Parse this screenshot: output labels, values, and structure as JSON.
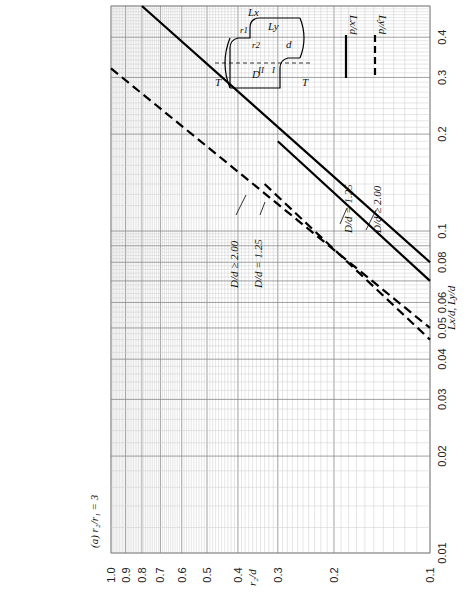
{
  "chart_data": {
    "type": "line",
    "xlabel": "r2/d",
    "ylabel": "Lx/d, Ly/d",
    "x_scale": "log",
    "y_scale": "log",
    "xlim": [
      1.0,
      0.1
    ],
    "ylim": [
      0.01,
      0.5
    ],
    "x_ticks": [
      "1.0",
      "0.9",
      "0.8",
      "0.7",
      "0.6",
      "0.5",
      "0.4",
      "0.3",
      "0.2",
      "0.1"
    ],
    "y_ticks": [
      "0.01",
      "0.02",
      "0.03",
      "0.04",
      "0.05",
      "0.06",
      "0.08",
      "0.1",
      "0.2",
      "0.3",
      "0.4"
    ],
    "grid": true,
    "legend": [
      {
        "label": "Lx/d",
        "style": "solid"
      },
      {
        "label": "Ly/d",
        "style": "dashed"
      }
    ],
    "legend_position": "top-right",
    "series": [
      {
        "name": "Lx/d, D/d ≥ 2.00",
        "style": "solid",
        "x": [
          0.8,
          0.1
        ],
        "y": [
          0.5,
          0.08
        ]
      },
      {
        "name": "Lx/d, D/d = 1.25",
        "style": "solid",
        "x": [
          0.3,
          0.1
        ],
        "y": [
          0.19,
          0.07
        ]
      },
      {
        "name": "Ly/d, D/d ≥ 2.00",
        "style": "dashed",
        "x": [
          1.0,
          0.1
        ],
        "y": [
          0.32,
          0.05
        ]
      },
      {
        "name": "Ly/d, D/d = 1.25",
        "style": "dashed",
        "x": [
          0.33,
          0.1
        ],
        "y": [
          0.14,
          0.046
        ]
      }
    ],
    "annotations": [
      "D/d ≥ 2.00",
      "D/d = 1.25",
      "D/d ≥ 2.00",
      "D/d = 1.25"
    ]
  },
  "labels": {
    "panel": "(a) r₂/r₁ = 3",
    "x_axis": "r₂/d",
    "y_axis": "Lx/d, Ly/d",
    "legend_solid": "Lx/d",
    "legend_dashed": "Ly/d",
    "ann_solid_125": "D/d = 1.25",
    "ann_solid_200": "D/d ≥ 2.00",
    "ann_dash_200": "D/d ≥ 2.00",
    "ann_dash_125": "D/d = 1.25",
    "diagram": {
      "T": "T",
      "D": "D",
      "d": "d",
      "Lx": "Lx",
      "Ly": "Ly",
      "r1": "r1",
      "r2": "r2",
      "I": "I",
      "II": "II"
    }
  }
}
